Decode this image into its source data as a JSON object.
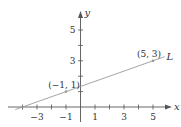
{
  "chart_data": {
    "type": "line",
    "title": "",
    "xlabel": "x",
    "ylabel": "y",
    "line_label": "L",
    "xlim": [
      -4.5,
      6.5
    ],
    "ylim": [
      -0.5,
      6
    ],
    "grid": false,
    "x_ticks": [
      -4,
      -3,
      -2,
      -1,
      1,
      2,
      3,
      4,
      5
    ],
    "x_tick_labels": [
      "-3",
      "-1",
      "1",
      "3",
      "5"
    ],
    "x_tick_label_values": [
      -3,
      -1,
      1,
      3,
      5
    ],
    "y_ticks": [
      1,
      2,
      3,
      4,
      5
    ],
    "y_tick_labels": [
      "3",
      "5"
    ],
    "y_tick_label_values": [
      3,
      5
    ],
    "series": [
      {
        "name": "L",
        "equation": "y = (x + 4) / 3",
        "x": [
          -4.5,
          -4,
          -1,
          5,
          5.8
        ],
        "y": [
          -0.167,
          0,
          1,
          3,
          3.267
        ]
      }
    ],
    "marked_points": [
      {
        "label": "(−1, 1)",
        "x": -1,
        "y": 1
      },
      {
        "label": "(5, 3)",
        "x": 5,
        "y": 3
      }
    ],
    "colors": {
      "axis": "#555555",
      "line": "#9a9a9a",
      "text": "#333333"
    }
  }
}
